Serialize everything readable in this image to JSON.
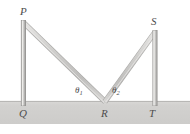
{
  "figure": {
    "kind": "physics-geometry-diagram",
    "background_color": "#ffffff",
    "ground": {
      "name": "ground-band",
      "fill_color": "#d3d2d0",
      "top_edge_color": "#b4b3b1",
      "x": 0,
      "y": 101,
      "width": 190,
      "height": 23
    },
    "poles": [
      {
        "name": "left-pole",
        "top_label": "P",
        "base_label": "Q",
        "x": 21,
        "width": 4.2,
        "top_y": 20,
        "bottom_y": 106,
        "fill_color": "#c9c8c6",
        "edge_color": "#8f8e8c"
      },
      {
        "name": "right-pole",
        "top_label": "S",
        "base_label": "T",
        "x": 152.6,
        "width": 4.2,
        "top_y": 30,
        "bottom_y": 106,
        "fill_color": "#c9c8c6",
        "edge_color": "#8f8e8c"
      }
    ],
    "beams": [
      {
        "name": "left-beam",
        "from_point": "P",
        "to_point": "R",
        "x1": 23.4,
        "y1": 22.5,
        "x2": 105.0,
        "y2": 101.5,
        "thickness": 4.6,
        "fill_color": "#cfcecc",
        "edge_color": "#a9a8a6"
      },
      {
        "name": "right-beam",
        "from_point": "S",
        "to_point": "R",
        "x1": 154.7,
        "y1": 32.5,
        "x2": 105.0,
        "y2": 101.5,
        "thickness": 4.6,
        "fill_color": "#cfcecc",
        "edge_color": "#a9a8a6"
      }
    ],
    "vertex": {
      "name": "vertex-point-R",
      "label": "R",
      "x": 105,
      "y": 101
    },
    "point_labels": [
      {
        "name": "point-label-P",
        "text": "P",
        "x": 20,
        "y": 6
      },
      {
        "name": "point-label-S",
        "text": "S",
        "x": 151,
        "y": 16
      },
      {
        "name": "point-label-Q",
        "text": "Q",
        "x": 19,
        "y": 108
      },
      {
        "name": "point-label-R",
        "text": "R",
        "x": 101,
        "y": 108
      },
      {
        "name": "point-label-T",
        "text": "T",
        "x": 149,
        "y": 108
      }
    ],
    "angle_labels": [
      {
        "name": "angle-label-theta-1",
        "symbol": "θ",
        "subscript": "1",
        "at_vertex": "R",
        "side": "left",
        "x": 75,
        "y": 86
      },
      {
        "name": "angle-label-theta-2",
        "symbol": "θ",
        "subscript": "2",
        "at_vertex": "R",
        "side": "right",
        "x": 112,
        "y": 86
      }
    ],
    "colors": {
      "ground_fill": "#d3d2d0",
      "ground_edge": "#b4b3b1",
      "member_fill": "#cfcecc",
      "member_edge": "#a9a8a6",
      "label_text": "#4d4d4d"
    }
  }
}
